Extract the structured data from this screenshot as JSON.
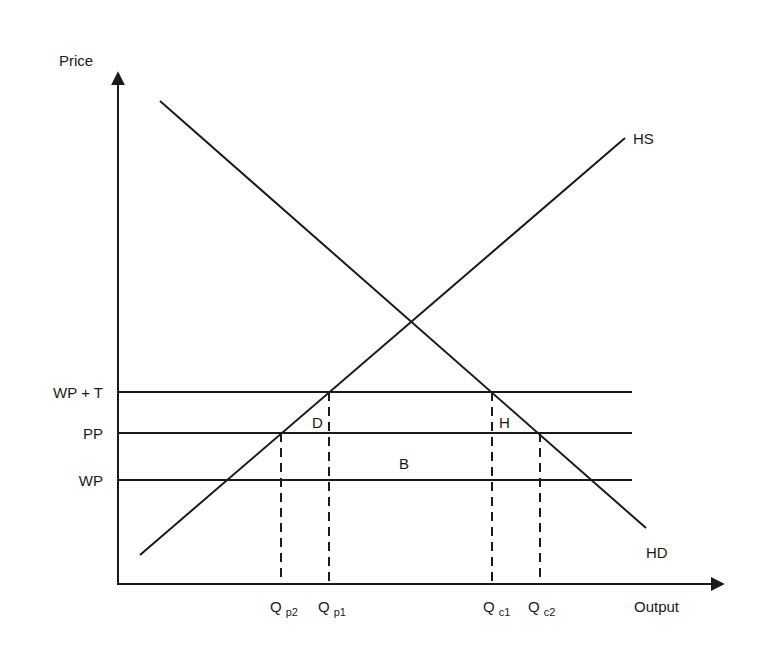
{
  "diagram": {
    "type": "supply-demand-tariff",
    "axes": {
      "y_label": "Price",
      "x_label": "Output"
    },
    "curves": {
      "supply_label": "HS",
      "demand_label": "HD"
    },
    "price_levels": [
      {
        "key": "wpt",
        "label": "WP + T"
      },
      {
        "key": "pp",
        "label": "PP"
      },
      {
        "key": "wp",
        "label": "WP"
      }
    ],
    "quantities": [
      {
        "key": "qp2",
        "main": "Q",
        "sub": "p2"
      },
      {
        "key": "qp1",
        "main": "Q",
        "sub": "p1"
      },
      {
        "key": "qc1",
        "main": "Q",
        "sub": "c1"
      },
      {
        "key": "qc2",
        "main": "Q",
        "sub": "c2"
      }
    ],
    "areas": {
      "d": "D",
      "h": "H",
      "b": "B"
    }
  }
}
